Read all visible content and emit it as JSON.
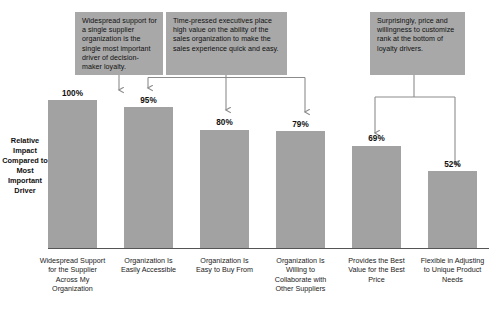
{
  "chart_data": {
    "type": "bar",
    "title": "",
    "xlabel": "",
    "ylabel": "Relative Impact Compared to Most Important Driver",
    "ylim": [
      0,
      100
    ],
    "grid": false,
    "legend": "none",
    "categories": [
      "Widespread Support for the Supplier Across My Organization",
      "Organization Is Easily Accessible",
      "Organization Is Easy to Buy From",
      "Organization Is Willing to Collaborate with Other Suppliers",
      "Provides the Best Value for the Best Price",
      "Flexible in Adjusting to Unique Product Needs"
    ],
    "values": [
      100,
      95,
      80,
      79,
      69,
      52
    ],
    "value_labels": [
      "100%",
      "95%",
      "80%",
      "79%",
      "69%",
      "52%"
    ],
    "bar_color": "#a2a2a2",
    "annotations": [
      {
        "text": "Widespread support for a single supplier organization is the single most important driver of decision-maker loyalty.",
        "points_to": [
          0
        ]
      },
      {
        "text": "Time-pressed executives place high value on the ability of the sales organization to make the sales experience quick and easy.",
        "points_to": [
          1,
          2,
          3
        ]
      },
      {
        "text": "Surprisingly, price and willingness to customize rank at the bottom of loyalty drivers.",
        "points_to": [
          4,
          5
        ]
      }
    ],
    "annotation_box_color": "#a8a8a8"
  },
  "axis": {
    "y_title": "Relative Impact Compared to Most Important Driver"
  }
}
